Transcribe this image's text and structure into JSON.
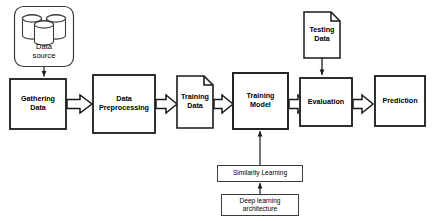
{
  "diagram": {
    "background_color": "#ffffff",
    "stroke_color": "#1a1a1a",
    "thin_stroke_color": "#3c3c3c",
    "fill_color": "#ffffff"
  },
  "nodes": {
    "data_source": {
      "label": "Data\nsource",
      "shape": "rounded-rect-with-database-cylinders"
    },
    "gathering_data": {
      "label": "Gathering\nData",
      "shape": "rectangle"
    },
    "data_preprocessing": {
      "label": "Data\nPreprocessing",
      "shape": "rectangle"
    },
    "training_data": {
      "label": "Training\nData",
      "shape": "document"
    },
    "training_model": {
      "label": "Training\nModel",
      "shape": "rectangle"
    },
    "testing_data": {
      "label": "Testing\nData",
      "shape": "document"
    },
    "evaluation": {
      "label": "Evaluation",
      "shape": "rectangle"
    },
    "prediction": {
      "label": "Prediction",
      "shape": "rectangle"
    },
    "similarity_learning": {
      "label": "Similarity Learning",
      "shape": "thin-rectangle"
    },
    "deep_learning_architecture": {
      "label": "Deep learning\narchitecture",
      "shape": "thin-rectangle"
    }
  },
  "connections": [
    {
      "name": "data-source-to-gathering-data",
      "type": "line-arrow"
    },
    {
      "name": "gathering-data-to-data-preprocessing",
      "type": "block-arrow"
    },
    {
      "name": "data-preprocessing-to-training-data",
      "type": "block-arrow"
    },
    {
      "name": "training-data-to-training-model",
      "type": "block-arrow"
    },
    {
      "name": "training-model-to-evaluation",
      "type": "block-arrow"
    },
    {
      "name": "evaluation-to-prediction",
      "type": "block-arrow"
    },
    {
      "name": "testing-data-to-evaluation",
      "type": "line-arrow"
    },
    {
      "name": "similarity-learning-to-training-model",
      "type": "line-arrow"
    },
    {
      "name": "deep-learning-architecture-to-similarity-learning",
      "type": "line-arrow"
    }
  ]
}
